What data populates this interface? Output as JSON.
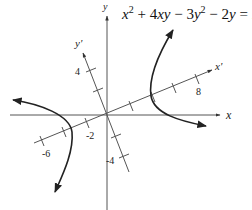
{
  "figure": {
    "equation": {
      "parts": [
        "x",
        "2",
        " + 4",
        "xy",
        " − 3",
        "y",
        "2",
        " − 2",
        "y",
        " = 24"
      ],
      "full_text": "x^2 + 4xy − 3y^2 − 2y = 24"
    },
    "axes": {
      "x_label": "x",
      "y_label": "y",
      "x_prime_label": "x'",
      "y_prime_label": "y'"
    },
    "tick_labels": {
      "x_prime_positive": "8",
      "x_prime_negative_2": "-2",
      "x_prime_negative_6": "-6",
      "y_prime_positive": "4",
      "y_prime_negative": "-4"
    },
    "colors": {
      "axis": "#555555",
      "curve": "#222222",
      "text": "#111111"
    }
  }
}
